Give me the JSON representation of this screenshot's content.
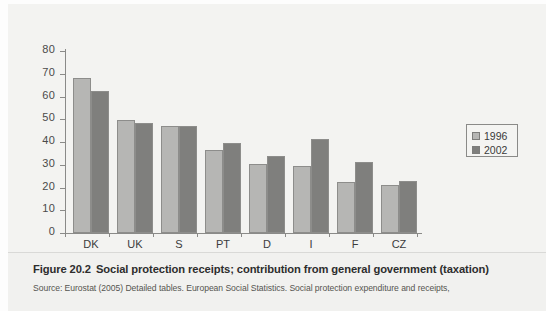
{
  "chart_data": {
    "type": "bar",
    "title": "Social protection receipts; contribution from general government (taxation)",
    "xlabel": "",
    "ylabel": "",
    "ylim": [
      0,
      80
    ],
    "yticks": [
      0,
      10,
      20,
      30,
      40,
      50,
      60,
      70,
      80
    ],
    "grid": false,
    "legend_position": "right",
    "categories": [
      "DK",
      "UK",
      "S",
      "PT",
      "D",
      "I",
      "F",
      "CZ"
    ],
    "series": [
      {
        "name": "1996",
        "color": "#b6b6b4",
        "values": [
          68,
          49.5,
          47,
          36.5,
          30.5,
          29.5,
          22.5,
          21
        ]
      },
      {
        "name": "2002",
        "color": "#7f7f7d",
        "values": [
          62.5,
          48.5,
          47,
          39.5,
          34,
          41.5,
          31,
          23
        ]
      }
    ]
  },
  "legend": {
    "items": [
      {
        "label": "1996"
      },
      {
        "label": "2002"
      }
    ]
  },
  "caption": {
    "figure_number": "Figure 20.2",
    "title": "Social protection receipts; contribution from general government (taxation)",
    "source": "Source: Eurostat (2005) Detailed tables. European Social Statistics. Social protection expenditure and receipts,"
  }
}
